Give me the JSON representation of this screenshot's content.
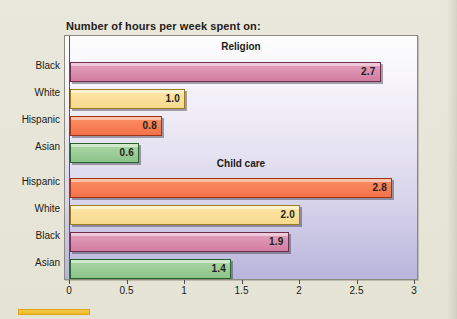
{
  "chart_data": {
    "type": "bar",
    "orientation": "horizontal",
    "title": "Number of hours per week spent on:",
    "xlabel": "",
    "ylabel": "",
    "xlim": [
      0,
      3
    ],
    "xticks": [
      "0",
      "0.5",
      "1",
      "1.5",
      "2",
      "2.5",
      "3"
    ],
    "grid": false,
    "legend": "none",
    "groups": [
      {
        "name": "Religion",
        "categories": [
          "Black",
          "White",
          "Hispanic",
          "Asian"
        ],
        "values": [
          2.7,
          1.0,
          0.8,
          0.6
        ],
        "labels": [
          "2.7",
          "1.0",
          "0.8",
          "0.6"
        ],
        "colors": [
          "#d37da0",
          "#f7d98d",
          "#f4724a",
          "#8cc389"
        ]
      },
      {
        "name": "Child care",
        "categories": [
          "Hispanic",
          "White",
          "Black",
          "Asian"
        ],
        "values": [
          2.8,
          2.0,
          1.9,
          1.4
        ],
        "labels": [
          "2.8",
          "2.0",
          "1.9",
          "1.4"
        ],
        "colors": [
          "#f4724a",
          "#f7d98d",
          "#d37da0",
          "#8cc389"
        ]
      }
    ],
    "colors": {
      "black_series": "#d37da0",
      "white_series": "#f7d98d",
      "hispanic_series": "#f4724a",
      "asian_series": "#8cc389",
      "plot_bg_top": "#fdfdfd",
      "plot_bg_bottom": "#b8b5dc",
      "page_bg": "#e8e7da"
    }
  }
}
